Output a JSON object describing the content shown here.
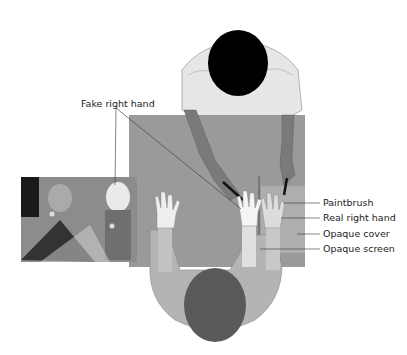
{
  "diagram": {
    "labels": {
      "fake_hand": "Fake right hand",
      "paintbrush": "Paintbrush",
      "real_hand": "Real right hand",
      "opaque_cover": "Opaque cover",
      "opaque_screen": "Opaque screen"
    },
    "colors": {
      "table": "#9a9a9a",
      "cover": "#a8a8a8",
      "experimenter_shirt": "#e6e6e6",
      "experimenter_hair": "#000000",
      "experimenter_arm": "#7a7a7a",
      "participant_shirt": "#b4b4b4",
      "participant_hair": "#5a5a5a",
      "hand": "#efefef",
      "photo_bg": "#8c8c8c"
    }
  }
}
